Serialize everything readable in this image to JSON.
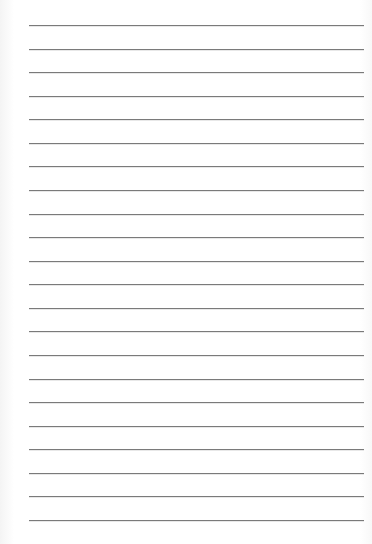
{
  "page": {
    "type": "lined-paper",
    "background_color": "#ffffff",
    "line_color": "#7a7a7a",
    "line_count": 22,
    "first_line_y": 25,
    "line_spacing": 23.57,
    "line_left": 29,
    "line_right": 364,
    "lines": [
      "",
      "",
      "",
      "",
      "",
      "",
      "",
      "",
      "",
      "",
      "",
      "",
      "",
      "",
      "",
      "",
      "",
      "",
      "",
      "",
      "",
      ""
    ]
  }
}
